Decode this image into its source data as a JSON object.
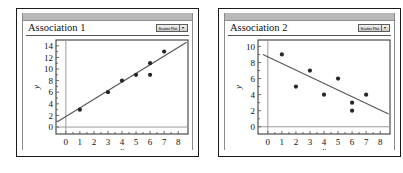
{
  "page": {
    "background": "#ffffff",
    "panel_count": 2
  },
  "panels": [
    {
      "title": "Association 1",
      "badge": {
        "label": "Scatter Plot",
        "caret": "▾",
        "icon": "chevron-down-icon"
      },
      "chart_index": 0
    },
    {
      "title": "Association 2",
      "badge": {
        "label": "Scatter Plot",
        "caret": "▾",
        "icon": "chevron-down-icon"
      },
      "chart_index": 1
    }
  ],
  "chart_data": [
    {
      "type": "scatter",
      "title": "Association 1",
      "xlabel": "x",
      "ylabel": "y",
      "xlim": [
        -0.7,
        8.7
      ],
      "ylim": [
        -1.2,
        15.0
      ],
      "xticks": [
        0,
        1,
        2,
        3,
        4,
        5,
        6,
        7,
        8
      ],
      "yticks": [
        0,
        2,
        4,
        6,
        8,
        10,
        12,
        14
      ],
      "xtick_labels": [
        "0",
        "1",
        "2",
        "3",
        "4",
        "5",
        "6",
        "7",
        "8"
      ],
      "ytick_labels": [
        "0",
        "2",
        "4",
        "6",
        "8",
        "10",
        "12",
        "14"
      ],
      "grid": false,
      "legend": null,
      "association": "positive linear",
      "points": [
        {
          "x": 1,
          "y": 3
        },
        {
          "x": 3,
          "y": 6
        },
        {
          "x": 4,
          "y": 8
        },
        {
          "x": 5,
          "y": 9
        },
        {
          "x": 6,
          "y": 9
        },
        {
          "x": 6,
          "y": 11
        },
        {
          "x": 7,
          "y": 13
        }
      ],
      "trend_line": {
        "x1": -0.6,
        "y1": 0.9,
        "x2": 8.6,
        "y2": 14.6,
        "slope": 1.49,
        "intercept": 1.79
      }
    },
    {
      "type": "scatter",
      "title": "Association 2",
      "xlabel": "x",
      "ylabel": "y",
      "xlim": [
        -0.7,
        8.7
      ],
      "ylim": [
        -0.9,
        10.8
      ],
      "xticks": [
        0,
        1,
        2,
        3,
        4,
        5,
        6,
        7,
        8
      ],
      "yticks": [
        0,
        2,
        4,
        6,
        8,
        10
      ],
      "xtick_labels": [
        "0",
        "1",
        "2",
        "3",
        "4",
        "5",
        "6",
        "7",
        "8"
      ],
      "ytick_labels": [
        "0",
        "2",
        "4",
        "6",
        "8",
        "10"
      ],
      "grid": false,
      "legend": null,
      "association": "negative linear",
      "points": [
        {
          "x": 1,
          "y": 9
        },
        {
          "x": 2,
          "y": 5
        },
        {
          "x": 3,
          "y": 7
        },
        {
          "x": 4,
          "y": 4
        },
        {
          "x": 5,
          "y": 6
        },
        {
          "x": 6,
          "y": 3
        },
        {
          "x": 6,
          "y": 2
        },
        {
          "x": 7,
          "y": 4
        }
      ],
      "trend_line": {
        "x1": -0.35,
        "y1": 9.0,
        "x2": 8.6,
        "y2": 1.6,
        "slope": -0.827,
        "intercept": 8.71
      }
    }
  ]
}
